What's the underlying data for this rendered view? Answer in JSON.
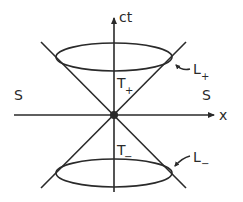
{
  "diagram": {
    "type": "light-cone",
    "colors": {
      "ink": "#2a2a2a",
      "background": "#ffffff"
    },
    "axes": {
      "vertical": {
        "label": "ct"
      },
      "horizontal": {
        "label": "x"
      }
    },
    "regions": {
      "left": {
        "label": "S"
      },
      "right": {
        "label": "S"
      },
      "future": {
        "main": "T",
        "sub": "+"
      },
      "past": {
        "main": "T",
        "sub": "−"
      }
    },
    "cone_labels": {
      "upper": {
        "main": "L",
        "sub": "+"
      },
      "lower": {
        "main": "L",
        "sub": "−"
      }
    }
  }
}
